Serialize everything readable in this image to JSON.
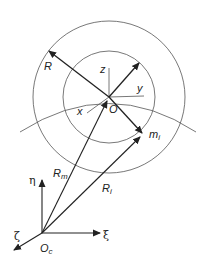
{
  "diagram": {
    "title": "",
    "labels": {
      "R": "R",
      "z": "z",
      "y": "y",
      "x": "x",
      "O": "O",
      "m_base": "m",
      "m_sub": "i",
      "Rm_base": "R",
      "Rm_sub": "m",
      "Ri_base": "R",
      "Ri_sub": "i",
      "eta": "η",
      "xi": "ξ",
      "zeta": "ζ",
      "Oc_base": "O",
      "Oc_sub": "c"
    },
    "colors": {
      "stroke": "#222222",
      "thin": "#555555",
      "background": "#ffffff"
    }
  }
}
